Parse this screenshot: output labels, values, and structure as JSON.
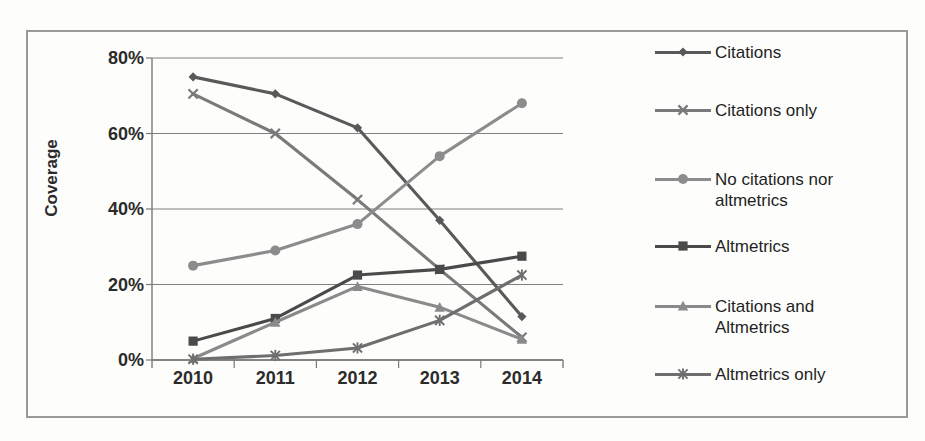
{
  "figure": {
    "border_color": "#9a9a9a",
    "background": "#ffffff"
  },
  "chart_data": {
    "type": "line",
    "title": "",
    "subtitle": "",
    "xlabel": "",
    "ylabel": "Coverage",
    "categories": [
      "2010",
      "2011",
      "2012",
      "2013",
      "2014"
    ],
    "x": [
      2010,
      2011,
      2012,
      2013,
      2014
    ],
    "ylim": [
      0,
      80
    ],
    "ytick_labels": [
      "0%",
      "20%",
      "40%",
      "60%",
      "80%"
    ],
    "ytick_values": [
      0,
      20,
      40,
      60,
      80
    ],
    "grid": "horizontal",
    "legend_position": "right",
    "value_unit": "%",
    "series": [
      {
        "name": "Citations",
        "marker": "diamond",
        "color": "#595959",
        "values": [
          75,
          70.5,
          61.5,
          37,
          11.5
        ]
      },
      {
        "name": "Citations only",
        "marker": "x",
        "color": "#7a7a7a",
        "values": [
          70.5,
          60,
          42.5,
          24,
          6
        ]
      },
      {
        "name": "No citations nor altmetrics",
        "marker": "circle",
        "color": "#8c8c8c",
        "values": [
          25,
          29,
          36,
          54,
          68
        ]
      },
      {
        "name": "Altmetrics",
        "marker": "square",
        "color": "#4a4a4a",
        "values": [
          5,
          11,
          22.5,
          24,
          27.5
        ]
      },
      {
        "name": "Citations and Altmetrics",
        "marker": "triangle",
        "color": "#8a8a8a",
        "values": [
          0.4,
          10,
          19.5,
          14,
          5.5
        ]
      },
      {
        "name": "Altmetrics only",
        "marker": "star",
        "color": "#6e6e6e",
        "values": [
          0.2,
          1.2,
          3.2,
          10.5,
          22.5
        ]
      }
    ]
  },
  "legend": {
    "entries": [
      {
        "label": "Citations",
        "marker": "diamond-marker-icon"
      },
      {
        "label": "Citations only",
        "marker": "x-marker-icon"
      },
      {
        "label": "No citations nor\naltmetrics",
        "marker": "circle-marker-icon"
      },
      {
        "label": "Altmetrics",
        "marker": "square-marker-icon"
      },
      {
        "label": "Citations and\nAltmetrics",
        "marker": "triangle-marker-icon"
      },
      {
        "label": "Altmetrics only",
        "marker": "star-marker-icon"
      }
    ]
  }
}
